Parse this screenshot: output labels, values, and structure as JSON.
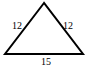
{
  "diagram": {
    "shape": "triangle",
    "type": "isosceles",
    "vertices": {
      "apex": [
        44,
        3
      ],
      "bottom_left": [
        5,
        54
      ],
      "bottom_right": [
        83,
        54
      ]
    },
    "sides": {
      "left": "12",
      "right": "12",
      "base": "15"
    },
    "stroke_color": "#000000",
    "background": "#ffffff"
  }
}
